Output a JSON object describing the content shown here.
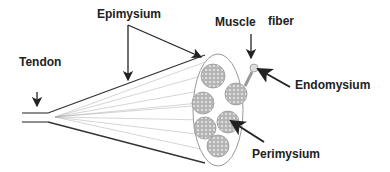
{
  "diagram": {
    "labels": {
      "epimysium": "Epimysium",
      "tendon": "Tendon",
      "muscle": "Muscle",
      "fiber": "fiber",
      "endomysium": "Endomysium",
      "perimysium": "Perimysium"
    },
    "colors": {
      "outline": "#333333",
      "fascicle_fill": "#b8b8b8",
      "fiber_dot": "#e6e6e6",
      "lines": "#999999"
    }
  }
}
